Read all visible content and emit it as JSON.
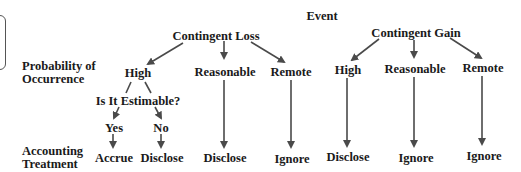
{
  "diagram": {
    "title": "Event",
    "row_labels": {
      "probability": [
        "Probability of",
        "Occurrence"
      ],
      "treatment": [
        "Accounting",
        "Treatment"
      ]
    },
    "loss": {
      "label": "Contingent Loss",
      "high": "High",
      "reasonable": "Reasonable",
      "remote": "Remote",
      "question": "Is It Estimable?",
      "yes": "Yes",
      "no": "No",
      "yes_treatment": "Accrue",
      "no_treatment": "Disclose",
      "reasonable_treatment": "Disclose",
      "remote_treatment": "Ignore"
    },
    "gain": {
      "label": "Contingent Gain",
      "high": "High",
      "reasonable": "Reasonable",
      "remote": "Remote",
      "high_treatment": "Disclose",
      "reasonable_treatment": "Ignore",
      "remote_treatment": "Ignore"
    },
    "colors": {
      "arrow": "#4a4a4a",
      "text": "#1a1a1a"
    }
  }
}
